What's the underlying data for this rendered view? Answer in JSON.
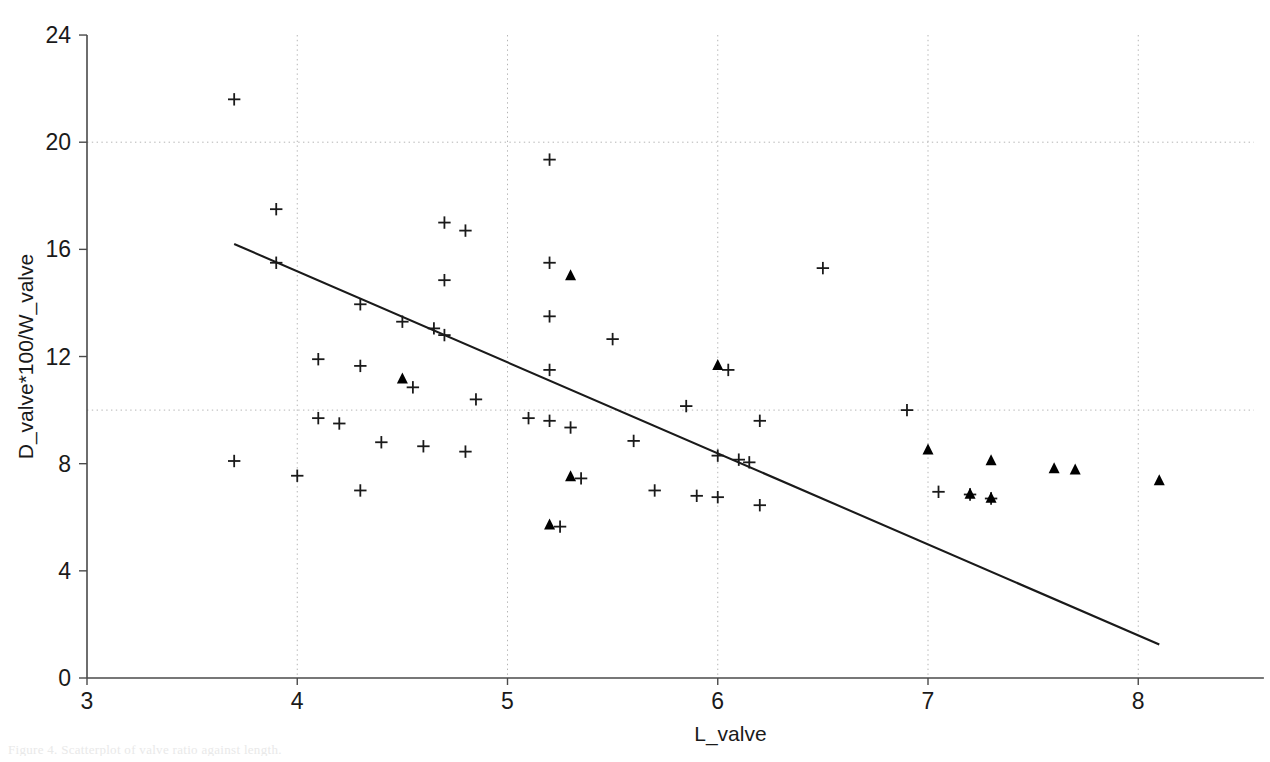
{
  "figure": {
    "background_color": "#ffffff",
    "ink_color": "#1a1a1a",
    "grid_color": "#b4b4b4",
    "caption_fragment": "Figure 4. Scatterplot of valve ratio against length."
  },
  "chart_data": {
    "type": "scatter",
    "title": "",
    "xlabel": "L_valve",
    "ylabel": "D_valve*100/W_valve",
    "xlim": [
      3,
      8.55
    ],
    "ylim": [
      0,
      24
    ],
    "xticks": [
      3,
      4,
      5,
      6,
      7,
      8
    ],
    "yticks": [
      0,
      4,
      8,
      12,
      16,
      20,
      24
    ],
    "xtick_labels": [
      "3",
      "4",
      "5",
      "6",
      "7",
      "8"
    ],
    "ytick_labels": [
      "0",
      "4",
      "8",
      "12",
      "16",
      "20",
      "24"
    ],
    "grid": true,
    "grid_style": "dotted",
    "gridlines_x": [
      4,
      5,
      6,
      7,
      8
    ],
    "gridlines_y": [
      10,
      20
    ],
    "legend": "none",
    "legend_position": "none",
    "series": [
      {
        "name": "plus-series",
        "marker": "plus",
        "color": "#1a1a1a",
        "points": [
          [
            3.7,
            21.6
          ],
          [
            3.7,
            8.1
          ],
          [
            3.9,
            17.5
          ],
          [
            3.9,
            15.5
          ],
          [
            4.0,
            7.55
          ],
          [
            4.1,
            11.9
          ],
          [
            4.1,
            9.7
          ],
          [
            4.2,
            9.5
          ],
          [
            4.3,
            11.65
          ],
          [
            4.3,
            13.95
          ],
          [
            4.3,
            7.0
          ],
          [
            4.4,
            8.8
          ],
          [
            4.5,
            13.3
          ],
          [
            4.55,
            10.85
          ],
          [
            4.6,
            8.65
          ],
          [
            4.65,
            13.05
          ],
          [
            4.7,
            17.0
          ],
          [
            4.7,
            14.85
          ],
          [
            4.7,
            12.8
          ],
          [
            4.8,
            16.7
          ],
          [
            4.8,
            8.45
          ],
          [
            4.85,
            10.4
          ],
          [
            5.1,
            9.7
          ],
          [
            5.2,
            19.35
          ],
          [
            5.2,
            15.5
          ],
          [
            5.2,
            9.6
          ],
          [
            5.2,
            11.5
          ],
          [
            5.2,
            13.5
          ],
          [
            5.25,
            5.65
          ],
          [
            5.3,
            9.35
          ],
          [
            5.35,
            7.45
          ],
          [
            5.5,
            12.65
          ],
          [
            5.6,
            8.85
          ],
          [
            5.7,
            7.0
          ],
          [
            5.85,
            10.15
          ],
          [
            5.9,
            6.8
          ],
          [
            6.0,
            6.75
          ],
          [
            6.0,
            8.3
          ],
          [
            6.05,
            11.5
          ],
          [
            6.1,
            8.15
          ],
          [
            6.15,
            8.05
          ],
          [
            6.2,
            6.45
          ],
          [
            6.2,
            9.6
          ],
          [
            6.5,
            15.3
          ],
          [
            6.9,
            10.0
          ],
          [
            7.05,
            6.95
          ],
          [
            7.2,
            6.85
          ],
          [
            7.3,
            6.7
          ]
        ]
      },
      {
        "name": "triangle-series",
        "marker": "triangle",
        "color": "#000000",
        "points": [
          [
            4.5,
            11.15
          ],
          [
            5.2,
            5.7
          ],
          [
            5.3,
            15.0
          ],
          [
            5.3,
            7.5
          ],
          [
            6.0,
            11.65
          ],
          [
            7.0,
            8.5
          ],
          [
            7.2,
            6.85
          ],
          [
            7.3,
            8.1
          ],
          [
            7.3,
            6.7
          ],
          [
            7.6,
            7.8
          ],
          [
            7.7,
            7.75
          ],
          [
            8.1,
            7.35
          ]
        ]
      }
    ],
    "trendline": {
      "name": "regression-line",
      "color": "#1a1a1a",
      "x_start": 3.7,
      "y_start": 16.2,
      "x_end": 8.1,
      "y_end": 1.25
    }
  }
}
